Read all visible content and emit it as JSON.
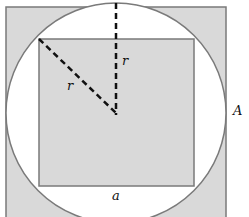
{
  "diagram": {
    "labels": {
      "radius_vertical": "r",
      "radius_diagonal": "r",
      "outer_square": "A",
      "inner_square_side": "a"
    },
    "colors": {
      "shaded_fill": "#d9d9d9",
      "circle_fill": "#ffffff",
      "stroke": "#7a7a7a",
      "dashed": "#111111"
    }
  }
}
